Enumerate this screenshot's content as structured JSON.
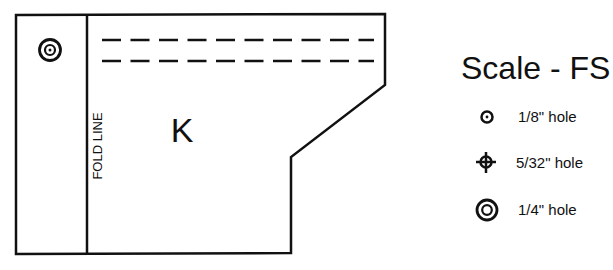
{
  "pattern": {
    "piece_label": "K",
    "fold_label": "FOLD LINE",
    "stroke_color": "#111111",
    "holes": [
      {
        "type": "1/4\" hole",
        "symbol": "double-ring"
      }
    ],
    "dashed_lines": 2
  },
  "legend": {
    "title": "Scale - FS",
    "items": [
      {
        "symbol": "single-ring",
        "label": "1/8\" hole"
      },
      {
        "symbol": "crosshair",
        "label": "5/32\" hole"
      },
      {
        "symbol": "double-ring",
        "label": "1/4\" hole"
      }
    ]
  }
}
